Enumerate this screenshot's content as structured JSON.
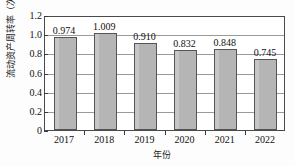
{
  "chart_data": {
    "type": "bar",
    "title": "",
    "xlabel": "年份",
    "ylabel": "流动资产周转率（次）",
    "categories": [
      "2017",
      "2018",
      "2019",
      "2020",
      "2021",
      "2022"
    ],
    "values": [
      0.974,
      1.009,
      0.91,
      0.832,
      0.848,
      0.745
    ],
    "value_labels": [
      "0.974",
      "1.009",
      "0.910",
      "0.832",
      "0.848",
      "0.745"
    ],
    "ylim": [
      0,
      1.2
    ],
    "ytick_labels": [
      "1.2",
      "1.0",
      "0.8",
      "0.6",
      "0.4",
      "0.2",
      "0"
    ],
    "ytick_values": [
      1.2,
      1.0,
      0.8,
      0.6,
      0.4,
      0.2,
      0
    ],
    "grid": true,
    "legend": false,
    "legend_position": "none",
    "series_name": "流动资产周转率",
    "bar_fill_color": "#b5b5b5",
    "bar_edge_color": "#555555",
    "grid_color": "#9a9a9a",
    "axis_color": "#4a4a4a",
    "background_color": "#fdfdfd",
    "text_color": "#111111"
  }
}
